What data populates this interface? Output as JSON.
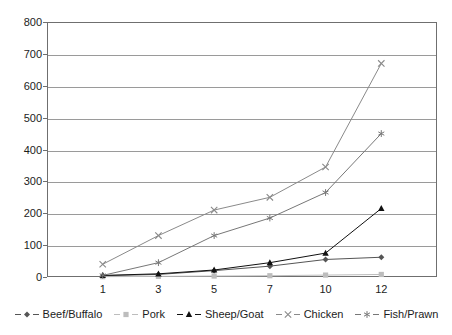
{
  "chart_data": {
    "type": "line",
    "title": "",
    "subtitle": "",
    "xlabel": "",
    "ylabel": "",
    "categories": [
      "1",
      "3",
      "5",
      "7",
      "10",
      "12"
    ],
    "xlim": [
      0,
      5
    ],
    "ylim": [
      0,
      800
    ],
    "ytick_values": [
      0,
      100,
      200,
      300,
      400,
      500,
      600,
      700,
      800
    ],
    "ytick_labels": [
      "0",
      "100",
      "200",
      "300",
      "400",
      "500",
      "600",
      "700",
      "800"
    ],
    "grid": true,
    "legend_position": "bottom",
    "series": [
      {
        "name": "Beef/Buffalo",
        "marker": "diamond",
        "color": "#555555",
        "values": [
          4,
          8,
          20,
          34,
          55,
          62
        ]
      },
      {
        "name": "Pork",
        "marker": "square",
        "color": "#bdbdbd",
        "values": [
          1,
          2,
          3,
          4,
          6,
          8
        ]
      },
      {
        "name": "Sheep/Goat",
        "marker": "triangle",
        "color": "#111111",
        "values": [
          5,
          10,
          22,
          45,
          75,
          215
        ]
      },
      {
        "name": "Chicken",
        "marker": "x",
        "color": "#8a8a8a",
        "values": [
          40,
          130,
          210,
          250,
          345,
          670
        ]
      },
      {
        "name": "Fish/Prawn",
        "marker": "star",
        "color": "#777777",
        "values": [
          5,
          45,
          130,
          185,
          265,
          450
        ]
      }
    ]
  }
}
